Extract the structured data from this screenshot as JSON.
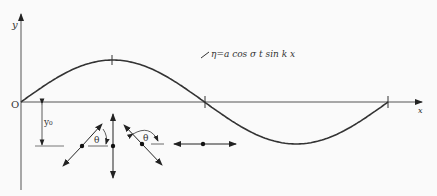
{
  "labels": {
    "y_axis": "y",
    "x_axis": "x",
    "origin": "O",
    "equation": "η=a  cos σ t  sin k x",
    "depth": "y₀",
    "theta_1": "θ",
    "theta_2": "θ"
  },
  "wave": {
    "type": "sine",
    "description": "standing wave profile over one wavelength",
    "crossings": [
      "0",
      "λ/2",
      "λ"
    ]
  },
  "particle_motions": [
    {
      "name": "inclined-left",
      "direction": "diagonal, rising to right"
    },
    {
      "name": "vertical",
      "direction": "vertical"
    },
    {
      "name": "inclined-right",
      "direction": "diagonal, rising to left"
    },
    {
      "name": "horizontal",
      "direction": "horizontal"
    }
  ]
}
